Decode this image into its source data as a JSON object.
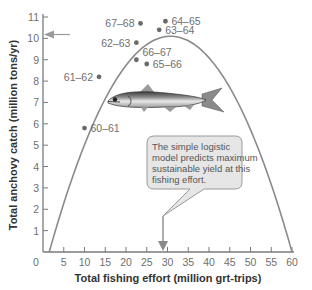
{
  "chart_data": {
    "type": "scatter",
    "title": "",
    "xlabel": "Total fishing effort (million grt-trips)",
    "ylabel": "Total anchovy catch (million tons/yr)",
    "xlim": [
      0,
      60
    ],
    "ylim": [
      0,
      11
    ],
    "x_ticks": [
      0,
      5,
      10,
      15,
      20,
      25,
      30,
      35,
      40,
      45,
      50,
      55,
      60
    ],
    "y_ticks": [
      1,
      2,
      3,
      4,
      5,
      6,
      7,
      8,
      9,
      10,
      11
    ],
    "grid": false,
    "points": [
      {
        "label": "60–61",
        "x": 10,
        "y": 5.8
      },
      {
        "label": "61–62",
        "x": 13.5,
        "y": 8.2
      },
      {
        "label": "62–63",
        "x": 22.5,
        "y": 9.8
      },
      {
        "label": "63–64",
        "x": 28,
        "y": 10.4
      },
      {
        "label": "64–65",
        "x": 29.5,
        "y": 10.8
      },
      {
        "label": "65–66",
        "x": 25,
        "y": 8.8
      },
      {
        "label": "66–67",
        "x": 22.5,
        "y": 9.0
      },
      {
        "label": "67–68",
        "x": 23.5,
        "y": 10.7
      }
    ],
    "model_curve": {
      "name": "Simple logistic model (parabola)",
      "x_zero_left": 1.5,
      "x_zero_right": 60,
      "peak_x": 28,
      "peak_y": 10.1
    },
    "annotations": [
      {
        "type": "arrow",
        "target_axis": "y",
        "value": 10.1,
        "description": "Arrow pointing to maximum sustainable yield on y-axis"
      },
      {
        "type": "arrow",
        "target_axis": "x",
        "value": 28,
        "description": "Arrow from callout pointing to MSY fishing effort on x-axis"
      },
      {
        "type": "callout",
        "text": "The simple logistic model predicts maximum sustainable yield at this fishing effort."
      }
    ],
    "colors": {
      "curve": "#8a8a8a",
      "points": "#6a6a6a",
      "axes": "#7a7a7a",
      "callout_fill": "#e6e6e6",
      "callout_border": "#9a9a9a"
    }
  },
  "axes": {
    "x_title": "Total fishing effort (million grt-trips)",
    "y_title": "Total anchovy catch (million tons/yr)",
    "origin_label": "0"
  },
  "callout": {
    "lines": [
      "The simple logistic",
      "model predicts maximum",
      "sustainable yield at this",
      "fishing effort."
    ]
  },
  "illustration": {
    "icon": "anchovy-fish-icon"
  }
}
